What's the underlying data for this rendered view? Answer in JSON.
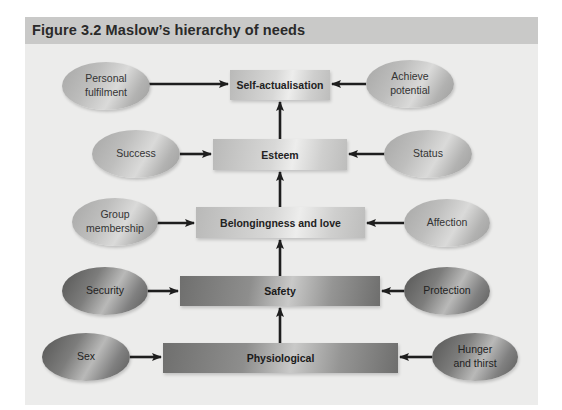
{
  "figure": {
    "title": "Figure 3.2  Maslow’s hierarchy of needs"
  },
  "levels": [
    {
      "id": "self_actualisation",
      "label": "Self-actualisation",
      "left": "Personal fulfilment",
      "left_lines": [
        "Personal",
        "fulfilment"
      ],
      "right": "Achieve potential",
      "right_lines": [
        "Achieve",
        "potential"
      ],
      "shade": "light"
    },
    {
      "id": "esteem",
      "label": "Esteem",
      "left": "Success",
      "left_lines": [
        "Success"
      ],
      "right": "Status",
      "right_lines": [
        "Status"
      ],
      "shade": "light"
    },
    {
      "id": "belongingness",
      "label": "Belongingness and love",
      "left": "Group membership",
      "left_lines": [
        "Group",
        "membership"
      ],
      "right": "Affection",
      "right_lines": [
        "Affection"
      ],
      "shade": "light"
    },
    {
      "id": "safety",
      "label": "Safety",
      "left": "Security",
      "left_lines": [
        "Security"
      ],
      "right": "Protection",
      "right_lines": [
        "Protection"
      ],
      "shade": "dark"
    },
    {
      "id": "physiological",
      "label": "Physiological",
      "left": "Sex",
      "left_lines": [
        "Sex"
      ],
      "right": "Hunger and thirst",
      "right_lines": [
        "Hunger",
        "and thirst"
      ],
      "shade": "dark"
    }
  ],
  "flow": "Physiological → Safety → Belongingness and love → Esteem → Self-actualisation"
}
